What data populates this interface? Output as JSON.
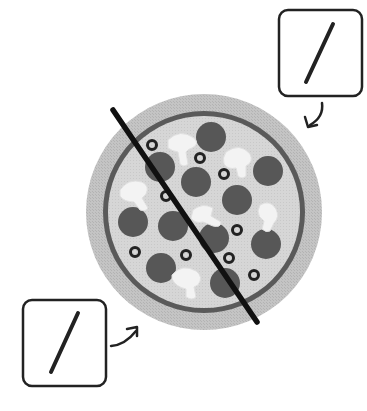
{
  "callouts": [
    {
      "id": "top-right",
      "symbol": "/",
      "arrow_direction": "down-left"
    },
    {
      "id": "bottom-left",
      "symbol": "/",
      "arrow_direction": "up-right"
    }
  ],
  "pizza": {
    "toppings": [
      "pepperoni",
      "mushroom",
      "olive"
    ],
    "cut_lines": 1
  },
  "colors": {
    "background": "#ffffff",
    "crust": "#bdbdbd",
    "sauce_ring": "#5a5a5a",
    "cheese": "#d4d4d4",
    "pepperoni": "#575757",
    "mushroom": "#f2f2f2",
    "olive": "#222222",
    "line": "#111111"
  }
}
